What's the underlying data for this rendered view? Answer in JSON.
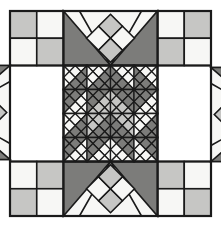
{
  "figure": {
    "canvas": {
      "width": 221,
      "height": 227
    },
    "background_color": "#ffffff"
  },
  "palette": {
    "light": "#f7f7f5",
    "medium": "#c6c6c4",
    "dark": "#7c7c7a",
    "line": "#1a1a1a",
    "border": "#1a1a1a"
  },
  "block": {
    "x": 10,
    "y": 11,
    "width": 201,
    "height": 205,
    "grid_columns": 3,
    "grid_rows": 3,
    "border_width": 2.2,
    "seam_width": 1.6
  },
  "geometry": {
    "col_edges": [
      10,
      63.5,
      157.5,
      211
    ],
    "row_edges": [
      11,
      65.5,
      161.5,
      216
    ],
    "medallion": {
      "x": 63.5,
      "y": 65.5,
      "width": 94,
      "height": 96,
      "cells": 4
    }
  },
  "regions": {
    "corner_top_left": {
      "name": "four-patch",
      "cells": [
        "medium",
        "light",
        "light",
        "medium"
      ]
    },
    "corner_top_right": {
      "name": "four-patch",
      "cells": [
        "light",
        "medium",
        "medium",
        "light"
      ]
    },
    "corner_bottom_left": {
      "name": "four-patch",
      "cells": [
        "light",
        "medium",
        "medium",
        "light"
      ]
    },
    "corner_bottom_right": {
      "name": "four-patch",
      "cells": [
        "medium",
        "light",
        "light",
        "medium"
      ]
    },
    "band_top": {
      "name": "chevron-band",
      "orientation": "down",
      "wings": "dark",
      "field": "light",
      "diamonds": [
        "medium",
        "light",
        "light",
        "medium"
      ]
    },
    "band_bottom": {
      "name": "chevron-band",
      "orientation": "up",
      "wings": "dark",
      "field": "light",
      "diamonds": [
        "medium",
        "light",
        "light",
        "medium"
      ]
    },
    "band_left": {
      "name": "chevron-band",
      "orientation": "right",
      "wings": "dark",
      "field": "light",
      "diamonds": [
        "medium",
        "light",
        "light",
        "medium"
      ]
    },
    "band_right": {
      "name": "chevron-band",
      "orientation": "left",
      "wings": "dark",
      "field": "light",
      "diamonds": [
        "medium",
        "light",
        "light",
        "medium"
      ]
    },
    "medallion": {
      "name": "pinwheel-medallion",
      "unit_type": "quarter-square-triangle",
      "rows": 4,
      "columns": 4
    }
  },
  "medallion_units": [
    [
      {
        "n": "light",
        "e": "dark",
        "s": "dark",
        "w": "light"
      },
      {
        "n": "light",
        "e": "dark",
        "s": "dark",
        "w": "light"
      },
      {
        "n": "light",
        "e": "light",
        "s": "dark",
        "w": "dark"
      },
      {
        "n": "light",
        "e": "light",
        "s": "dark",
        "w": "dark"
      }
    ],
    [
      {
        "n": "dark",
        "e": "light",
        "s": "light",
        "w": "dark"
      },
      {
        "n": "dark",
        "e": "medium",
        "s": "medium",
        "w": "dark"
      },
      {
        "n": "dark",
        "e": "dark",
        "s": "medium",
        "w": "medium"
      },
      {
        "n": "dark",
        "e": "light",
        "s": "light",
        "w": "dark"
      }
    ],
    [
      {
        "n": "light",
        "e": "dark",
        "s": "dark",
        "w": "light"
      },
      {
        "n": "medium",
        "e": "dark",
        "s": "dark",
        "w": "medium"
      },
      {
        "n": "medium",
        "e": "medium",
        "s": "dark",
        "w": "dark"
      },
      {
        "n": "light",
        "e": "dark",
        "s": "dark",
        "w": "light"
      }
    ],
    [
      {
        "n": "dark",
        "e": "light",
        "s": "light",
        "w": "dark"
      },
      {
        "n": "dark",
        "e": "light",
        "s": "light",
        "w": "dark"
      },
      {
        "n": "dark",
        "e": "dark",
        "s": "light",
        "w": "light"
      },
      {
        "n": "dark",
        "e": "dark",
        "s": "light",
        "w": "light"
      }
    ]
  ]
}
